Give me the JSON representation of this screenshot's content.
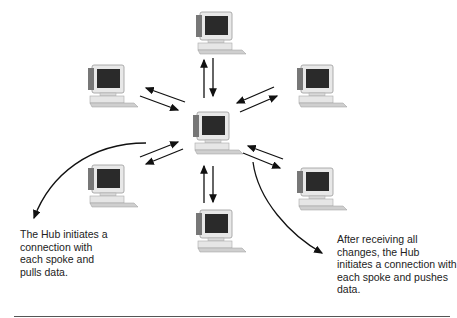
{
  "diagram": {
    "type": "hub-and-spoke replication",
    "hub": {
      "label": "Hub",
      "icon": "desktop-computer-icon"
    },
    "spokes": [
      {
        "position": "top",
        "icon": "desktop-computer-icon"
      },
      {
        "position": "upper-left",
        "icon": "desktop-computer-icon"
      },
      {
        "position": "upper-right",
        "icon": "desktop-computer-icon"
      },
      {
        "position": "lower-left",
        "icon": "desktop-computer-icon"
      },
      {
        "position": "lower-right",
        "icon": "desktop-computer-icon"
      },
      {
        "position": "bottom",
        "icon": "desktop-computer-icon"
      }
    ],
    "connections": "bidirectional-arrows between hub and each spoke"
  },
  "captions": {
    "left": "The Hub initiates a connection with each spoke and pulls data.",
    "right": "After receiving all changes, the Hub initiates a connection with each spoke and pushes data."
  },
  "colors": {
    "stroke": "#111111",
    "monitor_screen": "#2a2a2a",
    "computer_body": "#e6e6e6"
  }
}
